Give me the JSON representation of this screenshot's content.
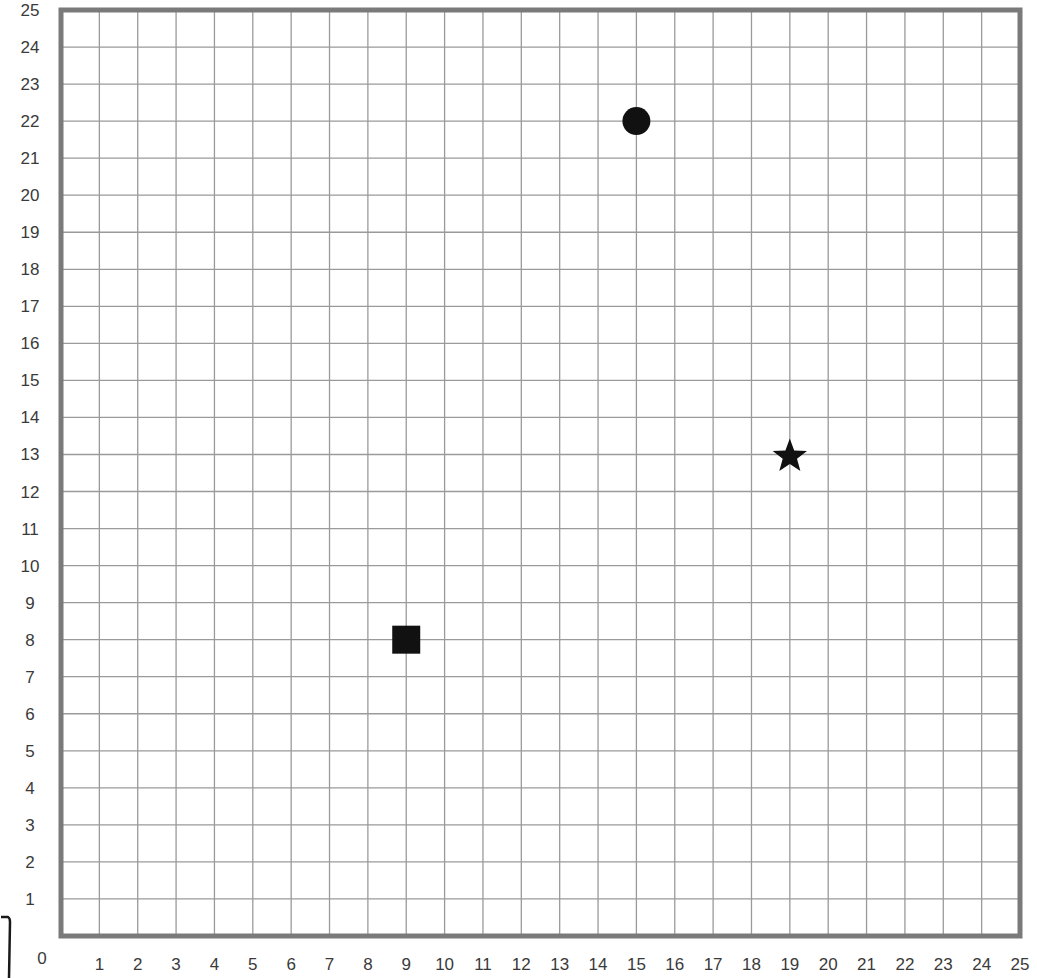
{
  "chart_data": {
    "type": "scatter",
    "title": "",
    "xlabel": "",
    "ylabel": "",
    "xlim": [
      0,
      25
    ],
    "ylim": [
      0,
      25
    ],
    "grid": true,
    "x_ticks": [
      1,
      2,
      3,
      4,
      5,
      6,
      7,
      8,
      9,
      10,
      11,
      12,
      13,
      14,
      15,
      16,
      17,
      18,
      19,
      20,
      21,
      22,
      23,
      24,
      25
    ],
    "y_ticks": [
      1,
      2,
      3,
      4,
      5,
      6,
      7,
      8,
      9,
      10,
      11,
      12,
      13,
      14,
      15,
      16,
      17,
      18,
      19,
      20,
      21,
      22,
      23,
      24,
      25
    ],
    "origin_label": "0",
    "series": [
      {
        "name": "circle",
        "marker": "circle",
        "points": [
          [
            15,
            22
          ]
        ]
      },
      {
        "name": "star",
        "marker": "star",
        "points": [
          [
            19,
            13
          ]
        ]
      },
      {
        "name": "square",
        "marker": "square",
        "points": [
          [
            9,
            8
          ]
        ]
      }
    ],
    "legend": null
  },
  "colors": {
    "frame": "#7a7a7a",
    "grid": "#9a9a9a",
    "marker": "#111111",
    "label": "#3a3a3a"
  }
}
